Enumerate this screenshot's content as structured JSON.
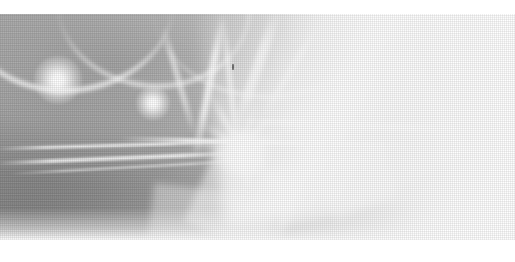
{
  "image": {
    "kind": "scanned-photograph",
    "subject_description": "High-key low-contrast abstract photograph resembling drifting smoke or translucent wisps of light, with two small bright point-lights at the upper left and a bright radiating star-burst form near the centre.",
    "medium_note": "Printed halftone reproduction; a fine regular dot/grid screen is visible across the whole plate.",
    "tonal_range": "mid-grey to paper white; no true blacks",
    "orientation": "landscape",
    "page_background": "#ffffff",
    "canvas": {
      "width": 515,
      "height": 262
    },
    "plate": {
      "left": 0,
      "top": 14,
      "width": 515,
      "height": 226
    }
  },
  "palette": {
    "paper_white": "#ffffff",
    "highlight": "#ffffff",
    "light_grey": "#e9e9e9",
    "mid_grey": "#b9b9b9",
    "shadow_grey": "#9a9a9a",
    "darkest_grey": "#767676",
    "speck_grey": "#5c5c5c"
  },
  "features": {
    "point_lights": [
      {
        "name": "upper-left-point-light",
        "x": 58,
        "y": 80,
        "radius": 24,
        "intensity": 1.0
      },
      {
        "name": "second-point-light",
        "x": 153,
        "y": 103,
        "radius": 17,
        "intensity": 0.92
      }
    ],
    "burst": {
      "name": "central-star-burst",
      "center_x": 244,
      "center_y": 148,
      "ray_count": 9,
      "ray_angles": [
        -86,
        -58,
        -30,
        -6,
        18,
        44,
        70,
        128,
        170
      ],
      "ray_lengths": [
        58,
        46,
        64,
        40,
        52,
        44,
        60,
        38,
        50
      ]
    },
    "arcs": [
      {
        "name": "upper-left-arc-outer"
      },
      {
        "name": "upper-left-arc-inner"
      },
      {
        "name": "upper-centre-arc"
      }
    ],
    "wisps": [
      {
        "name": "tendril-1"
      },
      {
        "name": "tendril-2"
      },
      {
        "name": "tendril-3"
      },
      {
        "name": "tendril-4"
      },
      {
        "name": "tendril-5"
      }
    ],
    "streaks": [
      {
        "name": "horizontal-streak-1"
      },
      {
        "name": "horizontal-streak-2"
      },
      {
        "name": "horizontal-streak-3"
      },
      {
        "name": "horizontal-streak-4"
      },
      {
        "name": "horizontal-streak-5"
      }
    ],
    "facets": [
      {
        "name": "pale-facet-1"
      },
      {
        "name": "pale-facet-2"
      },
      {
        "name": "pale-facet-3"
      },
      {
        "name": "pale-facet-4"
      }
    ],
    "speck": {
      "name": "dark-speck",
      "x": 232,
      "y": 64,
      "width": 2,
      "height": 6
    },
    "darkest_region": {
      "name": "lower-left-shadow-mass",
      "x": 0,
      "y": 150,
      "width": 150,
      "height": 90
    }
  },
  "text": {
    "visible_text": "",
    "accessible_caption": "Scanned halftone photograph: pale abstract smoke-like forms with bright point lights and a central star burst on a white page."
  }
}
